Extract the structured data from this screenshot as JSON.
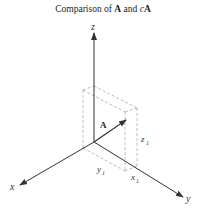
{
  "title": {
    "prefix": "Comparison of ",
    "vec": "A",
    "mid": " and ",
    "scalar": "c",
    "vec2": "A"
  },
  "diagram": {
    "axes": {
      "x_label": "x",
      "y_label": "y",
      "z_label": "z"
    },
    "vector_label": "A",
    "component_labels": {
      "x": "x",
      "x_sub": "1",
      "y": "y",
      "y_sub": "1",
      "z": "z",
      "z_sub": "1"
    },
    "colors": {
      "axis": "#333333",
      "box_dashed": "#aaaaaa",
      "vector": "#333333"
    }
  }
}
